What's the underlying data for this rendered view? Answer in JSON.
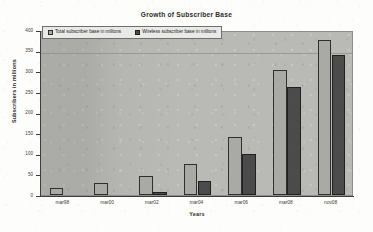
{
  "chart_data": {
    "type": "bar",
    "title": "Growth of Subscriber Base",
    "xlabel": "Years",
    "ylabel": "Subscribers in millions",
    "categories": [
      "mar98",
      "mar00",
      "mar02",
      "mar04",
      "mar06",
      "mar08",
      "nov08"
    ],
    "series": [
      {
        "name": "Total subscriber base in millions",
        "color": "#a9a9a6",
        "values": [
          18,
          28,
          45,
          76,
          141,
          303,
          377
        ]
      },
      {
        "name": "Wireless subscriber base in millions",
        "color": "#4b4b4b",
        "values": [
          0,
          0,
          8,
          34,
          100,
          263,
          340
        ]
      }
    ],
    "ylim": [
      0,
      400
    ],
    "ytick_step": 50,
    "yticks": [
      0,
      50,
      100,
      150,
      200,
      250,
      300,
      350,
      400
    ],
    "grid": true,
    "gridlines_visible_at": [
      350
    ],
    "legend_position": "inside-top-left",
    "plot_background": "#b9b9b6",
    "page_background": "#fdfdfc"
  }
}
